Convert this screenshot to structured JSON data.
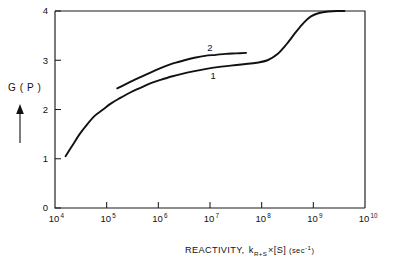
{
  "figure": {
    "background_color": "#ffffff",
    "ink_color": "#111111"
  },
  "axis": {
    "y_label_text": "G ( P )",
    "y_label_arrow_icon": "up-arrow-icon",
    "x_label_main": "REACTIVITY,",
    "x_label_k": "k",
    "x_label_k_subscript": "R+S",
    "x_label_times": "×[S]",
    "x_label_units": "(sec",
    "x_label_units_exp": "-1",
    "x_label_units_close": ")",
    "y_ticks": [
      "0",
      "1",
      "2",
      "3",
      "4"
    ],
    "x_tick_base": "10",
    "x_tick_exponents": [
      "4",
      "5",
      "6",
      "7",
      "8",
      "9",
      "10"
    ]
  },
  "curve_labels": [
    {
      "text": "2",
      "x": 10000000.0,
      "y": 3.18
    },
    {
      "text": "1",
      "x": 11500000.0,
      "y": 2.62
    }
  ],
  "chart_data": {
    "type": "line",
    "title": "",
    "xlabel": "REACTIVITY, k_{R+S} ×[S] (sec^-1)",
    "ylabel": "G (P)",
    "xscale": "log",
    "xlim": [
      10000,
      10000000000
    ],
    "ylim": [
      0,
      4
    ],
    "yticks": [
      0,
      1,
      2,
      3,
      4
    ],
    "xticks": [
      10000,
      100000,
      1000000,
      10000000,
      100000000,
      1000000000,
      10000000000
    ],
    "grid": false,
    "legend": "inline-curve-labels",
    "series": [
      {
        "name": "1",
        "label_position": {
          "x": 11500000.0,
          "y": 2.62
        },
        "points": [
          {
            "x": 16000.0,
            "y": 1.05
          },
          {
            "x": 22000.0,
            "y": 1.28
          },
          {
            "x": 30000.0,
            "y": 1.5
          },
          {
            "x": 42000.0,
            "y": 1.7
          },
          {
            "x": 60000.0,
            "y": 1.88
          },
          {
            "x": 85000.0,
            "y": 2.0
          },
          {
            "x": 120000.0,
            "y": 2.12
          },
          {
            "x": 180000.0,
            "y": 2.23
          },
          {
            "x": 280000.0,
            "y": 2.34
          },
          {
            "x": 450000.0,
            "y": 2.44
          },
          {
            "x": 700000.0,
            "y": 2.53
          },
          {
            "x": 1100000.0,
            "y": 2.6
          },
          {
            "x": 1800000.0,
            "y": 2.67
          },
          {
            "x": 3000000.0,
            "y": 2.73
          },
          {
            "x": 5000000.0,
            "y": 2.78
          },
          {
            "x": 8000000.0,
            "y": 2.82
          },
          {
            "x": 14000000.0,
            "y": 2.86
          },
          {
            "x": 25000000.0,
            "y": 2.89
          },
          {
            "x": 45000000.0,
            "y": 2.92
          },
          {
            "x": 80000000.0,
            "y": 2.95
          },
          {
            "x": 130000000.0,
            "y": 3.0
          },
          {
            "x": 200000000.0,
            "y": 3.12
          },
          {
            "x": 300000000.0,
            "y": 3.32
          },
          {
            "x": 450000000.0,
            "y": 3.56
          },
          {
            "x": 650000000.0,
            "y": 3.76
          },
          {
            "x": 900000000.0,
            "y": 3.89
          },
          {
            "x": 1300000000.0,
            "y": 3.96
          },
          {
            "x": 2000000000.0,
            "y": 3.99
          },
          {
            "x": 3000000000.0,
            "y": 4.0
          },
          {
            "x": 4000000000.0,
            "y": 4.0
          }
        ]
      },
      {
        "name": "2",
        "label_position": {
          "x": 10000000.0,
          "y": 3.18
        },
        "points": [
          {
            "x": 160000.0,
            "y": 2.43
          },
          {
            "x": 240000.0,
            "y": 2.52
          },
          {
            "x": 360000.0,
            "y": 2.61
          },
          {
            "x": 550000.0,
            "y": 2.7
          },
          {
            "x": 850000.0,
            "y": 2.79
          },
          {
            "x": 1300000.0,
            "y": 2.87
          },
          {
            "x": 2000000.0,
            "y": 2.94
          },
          {
            "x": 3200000.0,
            "y": 3.0
          },
          {
            "x": 5000000.0,
            "y": 3.05
          },
          {
            "x": 8000000.0,
            "y": 3.09
          },
          {
            "x": 13000000.0,
            "y": 3.11
          },
          {
            "x": 20000000.0,
            "y": 3.13
          },
          {
            "x": 32000000.0,
            "y": 3.14
          },
          {
            "x": 50000000.0,
            "y": 3.15
          }
        ]
      }
    ]
  }
}
